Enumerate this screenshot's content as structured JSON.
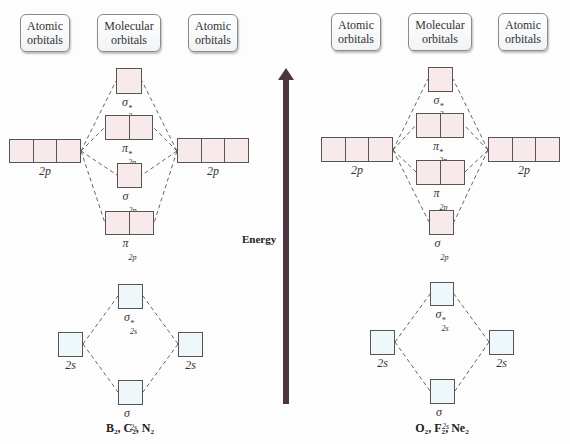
{
  "colors": {
    "p_orbital_fill": "#f8e9ea",
    "s_orbital_fill": "#eef7f9",
    "arrow": "#4a3540",
    "dash": "#555555"
  },
  "energy_axis": {
    "label": "Energy",
    "x": 286,
    "top": 68,
    "bottom": 404
  },
  "diagrams": [
    {
      "molecules_label": "B₂, C₂, N₂",
      "molecules_label_pos": [
        130,
        421
      ],
      "headers": [
        {
          "line1": "Atomic",
          "line2": "orbitals",
          "box": [
            20,
            14,
            50,
            38
          ]
        },
        {
          "line1": "Molecular",
          "line2": "orbitals",
          "box": [
            97,
            14,
            64,
            38
          ]
        },
        {
          "line1": "Atomic",
          "line2": "orbitals",
          "box": [
            188,
            14,
            50,
            38
          ]
        }
      ],
      "orbitals": [
        {
          "id": "sigma_star_2p",
          "type": "p",
          "cells": 1,
          "box": [
            116,
            68,
            26,
            26
          ],
          "label": "σ",
          "sub": "2p",
          "sup": "*"
        },
        {
          "id": "pi_star_2p",
          "type": "p",
          "cells": 2,
          "box": [
            105,
            115,
            48,
            25
          ],
          "label": "π",
          "sub": "2p",
          "sup": "*"
        },
        {
          "id": "atomic_2p_left",
          "type": "p",
          "cells": 3,
          "box": [
            9,
            139,
            72,
            24
          ],
          "label": "2p",
          "sub": "",
          "sup": ""
        },
        {
          "id": "atomic_2p_right",
          "type": "p",
          "cells": 3,
          "box": [
            177,
            138,
            72,
            25
          ],
          "label": "2p",
          "sub": "",
          "sup": ""
        },
        {
          "id": "sigma_2p",
          "type": "p",
          "cells": 1,
          "box": [
            117,
            163,
            25,
            25
          ],
          "label": "σ",
          "sub": "2p",
          "sup": ""
        },
        {
          "id": "pi_2p",
          "type": "p",
          "cells": 2,
          "box": [
            105,
            211,
            49,
            24
          ],
          "label": "π",
          "sub": "2p",
          "sup": ""
        },
        {
          "id": "sigma_star_2s",
          "type": "s",
          "cells": 1,
          "box": [
            118,
            284,
            25,
            25
          ],
          "label": "σ",
          "sub": "2s",
          "sup": "*"
        },
        {
          "id": "atomic_2s_left",
          "type": "s",
          "cells": 1,
          "box": [
            58,
            332,
            25,
            25
          ],
          "label": "2s",
          "sub": "",
          "sup": ""
        },
        {
          "id": "atomic_2s_right",
          "type": "s",
          "cells": 1,
          "box": [
            178,
            332,
            25,
            25
          ],
          "label": "2s",
          "sub": "",
          "sup": ""
        },
        {
          "id": "sigma_2s",
          "type": "s",
          "cells": 1,
          "box": [
            118,
            380,
            25,
            25
          ],
          "label": "σ",
          "sub": "2s",
          "sup": ""
        }
      ],
      "lines": [
        [
          81,
          151,
          116,
          81
        ],
        [
          81,
          151,
          105,
          127
        ],
        [
          81,
          151,
          117,
          175
        ],
        [
          81,
          151,
          105,
          223
        ],
        [
          177,
          151,
          142,
          81
        ],
        [
          177,
          151,
          153,
          127
        ],
        [
          177,
          151,
          142,
          175
        ],
        [
          177,
          151,
          154,
          223
        ],
        [
          83,
          344,
          118,
          296
        ],
        [
          83,
          344,
          118,
          392
        ],
        [
          178,
          344,
          143,
          296
        ],
        [
          178,
          344,
          143,
          392
        ]
      ]
    },
    {
      "molecules_label": "O₂, F₂, Ne₂",
      "molecules_label_pos": [
        442,
        421
      ],
      "headers": [
        {
          "line1": "Atomic",
          "line2": "orbitals",
          "box": [
            331,
            13,
            50,
            38
          ]
        },
        {
          "line1": "Molecular",
          "line2": "orbitals",
          "box": [
            408,
            13,
            64,
            38
          ]
        },
        {
          "line1": "Atomic",
          "line2": "orbitals",
          "box": [
            498,
            13,
            50,
            38
          ]
        }
      ],
      "orbitals": [
        {
          "id": "sigma_star_2p",
          "type": "p",
          "cells": 1,
          "box": [
            428,
            67,
            25,
            25
          ],
          "label": "σ",
          "sub": "2p",
          "sup": "*"
        },
        {
          "id": "pi_star_2p",
          "type": "p",
          "cells": 2,
          "box": [
            416,
            113,
            48,
            25
          ],
          "label": "π",
          "sub": "2p",
          "sup": "*"
        },
        {
          "id": "atomic_2p_left",
          "type": "p",
          "cells": 3,
          "box": [
            321,
            137,
            72,
            25
          ],
          "label": "2p",
          "sub": "",
          "sup": ""
        },
        {
          "id": "atomic_2p_right",
          "type": "p",
          "cells": 3,
          "box": [
            488,
            137,
            72,
            25
          ],
          "label": "2p",
          "sub": "",
          "sup": ""
        },
        {
          "id": "pi_2p",
          "type": "p",
          "cells": 2,
          "box": [
            416,
            160,
            49,
            25
          ],
          "label": "π",
          "sub": "2p",
          "sup": ""
        },
        {
          "id": "sigma_2p",
          "type": "p",
          "cells": 1,
          "box": [
            429,
            210,
            25,
            25
          ],
          "label": "σ",
          "sub": "2p",
          "sup": ""
        },
        {
          "id": "sigma_star_2s",
          "type": "s",
          "cells": 1,
          "box": [
            430,
            282,
            24,
            24
          ],
          "label": "σ",
          "sub": "2s",
          "sup": "*"
        },
        {
          "id": "atomic_2s_left",
          "type": "s",
          "cells": 1,
          "box": [
            370,
            330,
            25,
            25
          ],
          "label": "2s",
          "sub": "",
          "sup": ""
        },
        {
          "id": "atomic_2s_right",
          "type": "s",
          "cells": 1,
          "box": [
            489,
            330,
            25,
            25
          ],
          "label": "2s",
          "sub": "",
          "sup": ""
        },
        {
          "id": "sigma_2s",
          "type": "s",
          "cells": 1,
          "box": [
            430,
            379,
            25,
            25
          ],
          "label": "σ",
          "sub": "2s",
          "sup": ""
        }
      ],
      "lines": [
        [
          393,
          150,
          428,
          79
        ],
        [
          393,
          150,
          416,
          125
        ],
        [
          393,
          150,
          416,
          172
        ],
        [
          393,
          150,
          429,
          222
        ],
        [
          488,
          150,
          453,
          79
        ],
        [
          488,
          150,
          464,
          125
        ],
        [
          488,
          150,
          465,
          172
        ],
        [
          488,
          150,
          454,
          222
        ],
        [
          395,
          342,
          430,
          294
        ],
        [
          395,
          342,
          430,
          391
        ],
        [
          489,
          342,
          454,
          294
        ],
        [
          489,
          342,
          455,
          391
        ]
      ]
    }
  ]
}
